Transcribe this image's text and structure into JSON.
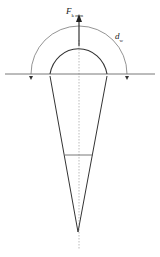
{
  "diagram": {
    "force_label": {
      "main": "F",
      "subscript": "k mm"
    },
    "diameter_label": {
      "main": "d",
      "subscript": "w"
    },
    "colors": {
      "stroke": "#333333",
      "background": "#ffffff"
    }
  }
}
